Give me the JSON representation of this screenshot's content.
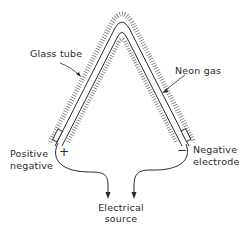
{
  "diagram": {
    "labels": {
      "glass_tube": "Glass tube",
      "neon_gas": "Neon gas",
      "positive_line1": "Positive",
      "positive_line2": "negative",
      "negative_line1": "Negative",
      "negative_line2": "electrode",
      "source_line1": "Electrical",
      "source_line2": "source"
    },
    "symbols": {
      "plus": "+",
      "minus": "−"
    },
    "colors": {
      "ink": "#2a2a2a",
      "hatch": "#6a6a6a",
      "background": "#ffffff"
    }
  }
}
